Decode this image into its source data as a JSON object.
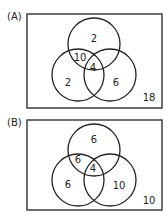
{
  "diagrams": [
    {
      "label": "(A)",
      "regions": {
        "top_only": "2",
        "top_left": "10",
        "center": "4",
        "left_only": "2",
        "right_only": "6",
        "outside": "18"
      }
    },
    {
      "label": "(B)",
      "regions": {
        "top_only": "6",
        "top_left": "6",
        "center": "4",
        "left_only": "6",
        "right_only": "10",
        "outside": "10"
      }
    }
  ]
}
